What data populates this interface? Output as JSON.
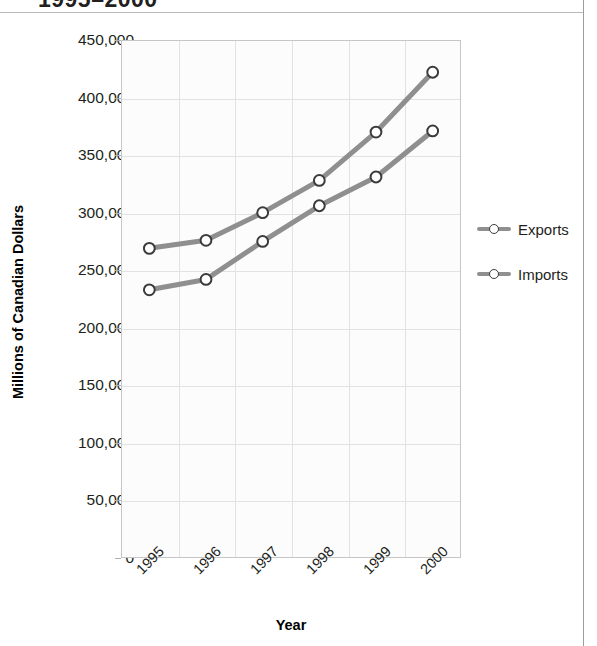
{
  "chart_title": "1995–2000",
  "axis": {
    "y_title": "Millions of Canadian Dollars",
    "x_title": "Year"
  },
  "legend": {
    "items": [
      {
        "label": "Exports",
        "color": "#8f8f8f"
      },
      {
        "label": "Imports",
        "color": "#8f8f8f"
      }
    ]
  },
  "y_ticks": [
    {
      "label": "450,000",
      "value": 450000
    },
    {
      "label": "400,000",
      "value": 400000
    },
    {
      "label": "350,000",
      "value": 350000
    },
    {
      "label": "300,000",
      "value": 300000
    },
    {
      "label": "250,000",
      "value": 250000
    },
    {
      "label": "200,000",
      "value": 200000
    },
    {
      "label": "150,000",
      "value": 150000
    },
    {
      "label": "100,000",
      "value": 100000
    },
    {
      "label": "50,000",
      "value": 50000
    },
    {
      "label": "0",
      "value": 0
    }
  ],
  "chart_data": {
    "type": "line",
    "title": "1995–2000",
    "xlabel": "Year",
    "ylabel": "Millions of Canadian Dollars",
    "categories": [
      "1995",
      "1996",
      "1997",
      "1998",
      "1999",
      "2000"
    ],
    "series": [
      {
        "name": "Exports",
        "values": [
          269000,
          276000,
          300000,
          328000,
          370000,
          422000
        ]
      },
      {
        "name": "Imports",
        "values": [
          233000,
          242000,
          275000,
          306000,
          331000,
          371000
        ]
      }
    ],
    "ylim": [
      0,
      450000
    ],
    "ytick_step": 50000,
    "grid": true,
    "legend_position": "right",
    "marker": "open-circle",
    "line_color": "#8f8f8f",
    "marker_fill": "#ffffff",
    "marker_edge": "#3b3b3b"
  }
}
